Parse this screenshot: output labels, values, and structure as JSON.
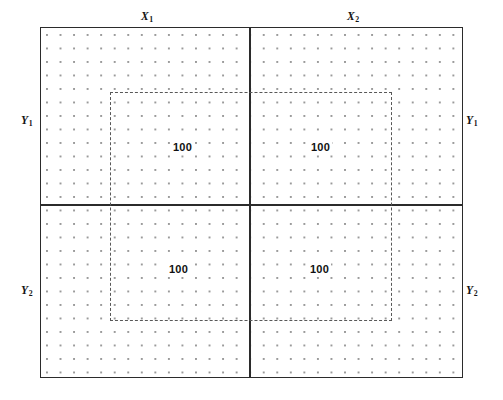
{
  "figure": {
    "type": "two-by-two-factorial-grid-diagram",
    "background_color": "#ffffff",
    "frame_color": "#2b2b2b",
    "dashed_color": "#585858",
    "dot_color": "#9a9a9a"
  },
  "axes": {
    "top": [
      {
        "id": "x1",
        "label": "X",
        "subscript": "1"
      },
      {
        "id": "x2",
        "label": "X",
        "subscript": "2"
      }
    ],
    "left": [
      {
        "id": "y1",
        "label": "Y",
        "subscript": "1"
      },
      {
        "id": "y2",
        "label": "Y",
        "subscript": "2"
      }
    ],
    "right": [
      {
        "id": "y1",
        "label": "Y",
        "subscript": "1"
      },
      {
        "id": "y2",
        "label": "Y",
        "subscript": "2"
      }
    ]
  },
  "cells": [
    {
      "id": "x1-y1",
      "row": "Y1",
      "column": "X1",
      "value": "100"
    },
    {
      "id": "x2-y1",
      "row": "Y1",
      "column": "X2",
      "value": "100"
    },
    {
      "id": "x1-y2",
      "row": "Y2",
      "column": "X1",
      "value": "100"
    },
    {
      "id": "x2-y2",
      "row": "Y2",
      "column": "X2",
      "value": "100"
    }
  ],
  "chart_data": {
    "type": "heatmap",
    "title": "",
    "subtitle": "",
    "xlabel": "",
    "ylabel": "",
    "grid": true,
    "legend": null,
    "categories_x": [
      "X1",
      "X2"
    ],
    "categories_y": [
      "Y1",
      "Y2"
    ],
    "values": [
      [
        100,
        100
      ],
      [
        100,
        100
      ]
    ],
    "annotations": [
      {
        "x": "X1",
        "y": "Y1",
        "text": "100"
      },
      {
        "x": "X2",
        "y": "Y1",
        "text": "100"
      },
      {
        "x": "X1",
        "y": "Y2",
        "text": "100"
      },
      {
        "x": "X2",
        "y": "Y2",
        "text": "100"
      }
    ],
    "overlay": {
      "shape": "rectangle",
      "style": "dashed",
      "spans": "center region crossing all four quadrants"
    }
  }
}
